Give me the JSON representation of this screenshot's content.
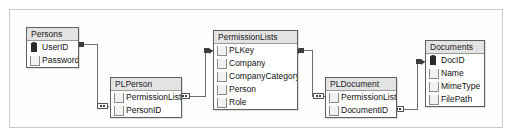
{
  "diagram": {
    "type": "entity-relationship-diagram",
    "background_color": "#ffffff",
    "frame_color": "#c9c9c9",
    "entity_header_color": "#e3e3e3",
    "entity_border_color": "#5f5f5f",
    "connector_color": "#6d6d6d"
  },
  "entities": [
    {
      "name": "Persons",
      "fields": [
        {
          "label": "UserID",
          "icon": "key-icon",
          "is_key": true
        },
        {
          "label": "Password",
          "icon": "column-icon",
          "is_key": false
        }
      ]
    },
    {
      "name": "PLPerson",
      "fields": [
        {
          "label": "PermissionListID",
          "icon": "column-icon",
          "is_key": false
        },
        {
          "label": "PersonID",
          "icon": "column-icon",
          "is_key": false
        }
      ]
    },
    {
      "name": "PermissionLists",
      "fields": [
        {
          "label": "PLKey",
          "icon": "column-icon",
          "is_key": false
        },
        {
          "label": "Company",
          "icon": "column-icon",
          "is_key": false
        },
        {
          "label": "CompanyCategory",
          "icon": "column-icon",
          "is_key": false
        },
        {
          "label": "Person",
          "icon": "column-icon",
          "is_key": false
        },
        {
          "label": "Role",
          "icon": "column-icon",
          "is_key": false
        }
      ]
    },
    {
      "name": "PLDocument",
      "fields": [
        {
          "label": "PermissionListID",
          "icon": "column-icon",
          "is_key": false
        },
        {
          "label": "DocumentID",
          "icon": "column-icon",
          "is_key": false
        }
      ]
    },
    {
      "name": "Documents",
      "fields": [
        {
          "label": "DocID",
          "icon": "key-icon",
          "is_key": true
        },
        {
          "label": "Name",
          "icon": "column-icon",
          "is_key": false
        },
        {
          "label": "MimeType",
          "icon": "column-icon",
          "is_key": false
        },
        {
          "label": "FilePath",
          "icon": "column-icon",
          "is_key": false
        }
      ]
    }
  ],
  "relationships": [
    {
      "from": "Persons",
      "from_field": "UserID",
      "to": "PLPerson",
      "to_field": "PersonID",
      "from_end": "one",
      "to_end": "many"
    },
    {
      "from": "PermissionLists",
      "from_field": "PLKey",
      "to": "PLPerson",
      "to_field": "PermissionListID",
      "from_end": "one",
      "to_end": "many"
    },
    {
      "from": "PermissionLists",
      "from_field": "PLKey",
      "to": "PLDocument",
      "to_field": "PermissionListID",
      "from_end": "one",
      "to_end": "many"
    },
    {
      "from": "Documents",
      "from_field": "DocID",
      "to": "PLDocument",
      "to_field": "DocumentID",
      "from_end": "one",
      "to_end": "many"
    }
  ]
}
